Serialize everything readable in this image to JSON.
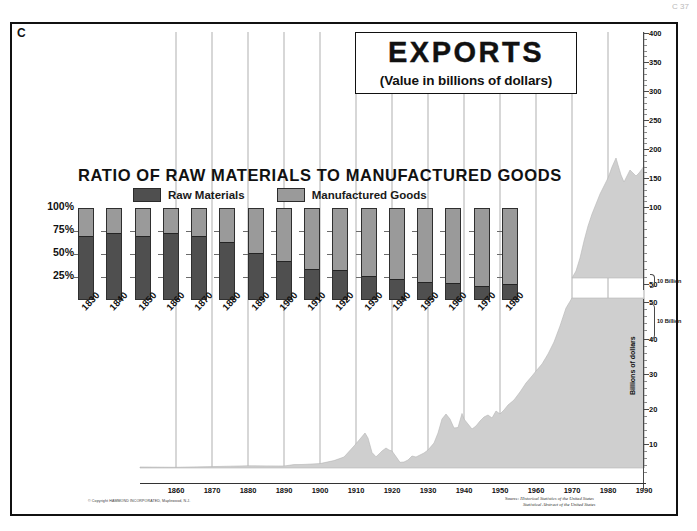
{
  "plate": {
    "letter": "C",
    "page_mark": "C 37"
  },
  "title": {
    "main": "EXPORTS",
    "subtitle": "(Value in billions of dollars)"
  },
  "ratio_panel": {
    "title": "RATIO OF RAW MATERIALS TO MANUFACTURED GOODS",
    "legend": [
      {
        "label": "Raw Materials",
        "color": "#4f4f4f",
        "key": "raw"
      },
      {
        "label": "Manufactured Goods",
        "color": "#9a9a9a",
        "key": "manufactured"
      }
    ],
    "y_ticks": [
      "100%",
      "75%",
      "50%",
      "25%"
    ]
  },
  "axes": {
    "upper_right_ticks": [
      "400",
      "350",
      "300",
      "250",
      "200",
      "150",
      "100",
      "50"
    ],
    "lower_right_ticks": [
      "50",
      "40",
      "30",
      "20",
      "10"
    ],
    "vertical_axis_title": "Billions of dollars",
    "break_note_upper": "10 Billion",
    "break_note_lower": "10 Billion",
    "timeline_years": [
      "1860",
      "1870",
      "1880",
      "1890",
      "1900",
      "1910",
      "1920",
      "1930",
      "1940",
      "1950",
      "1960",
      "1970",
      "1980",
      "1990"
    ]
  },
  "footer": {
    "copyright": "© Copyright HAMMOND INCORPORATED, Maplewood, N.J.",
    "source_label": "Source:",
    "source_line1": "Historical Statistics of the United States",
    "source_line2": "Statistical Abstract of the United States"
  },
  "colors": {
    "raw_materials": "#4f4f4f",
    "manufactured_goods": "#9a9a9a",
    "area_fill": "#cfcfcf",
    "frame": "#111111"
  },
  "chart_data": [
    {
      "type": "bar",
      "id": "ratio-stacked-bars",
      "title": "RATIO OF RAW MATERIALS TO MANUFACTURED GOODS",
      "xlabel": "",
      "ylabel": "",
      "ylim": [
        0,
        100
      ],
      "stacked": true,
      "grid": false,
      "legend_position": "top",
      "categories": [
        "1830",
        "1840",
        "1850",
        "1860",
        "1870",
        "1880",
        "1890",
        "1900",
        "1910",
        "1920",
        "1930",
        "1940",
        "1950",
        "1960",
        "1970",
        "1980"
      ],
      "tick_labels": [
        "100%",
        "75%",
        "50%",
        "25%"
      ],
      "series": [
        {
          "name": "Raw Materials",
          "color": "#4f4f4f",
          "values": [
            68,
            72,
            69,
            72,
            68,
            62,
            50,
            41,
            33,
            31,
            25,
            22,
            18,
            17,
            14,
            16
          ]
        },
        {
          "name": "Manufactured Goods",
          "color": "#9a9a9a",
          "values": [
            32,
            28,
            31,
            28,
            32,
            38,
            50,
            59,
            67,
            69,
            75,
            78,
            82,
            83,
            86,
            84
          ]
        }
      ]
    },
    {
      "type": "area",
      "id": "exports-value-area",
      "title": "EXPORTS",
      "subtitle": "(Value in billions of dollars)",
      "xlabel": "",
      "ylabel": "Billions of dollars",
      "grid": true,
      "axis_break": true,
      "xlim": [
        1860,
        1990
      ],
      "lower_ylim": [
        0,
        50
      ],
      "upper_ylim": [
        50,
        400
      ],
      "x": [
        1860,
        1865,
        1870,
        1875,
        1880,
        1885,
        1890,
        1895,
        1900,
        1905,
        1910,
        1915,
        1918,
        1920,
        1921,
        1922,
        1925,
        1929,
        1930,
        1932,
        1933,
        1935,
        1937,
        1938,
        1940,
        1942,
        1944,
        1945,
        1946,
        1947,
        1948,
        1949,
        1950,
        1951,
        1953,
        1955,
        1957,
        1958,
        1960,
        1962,
        1964,
        1966,
        1968,
        1970,
        1972,
        1974,
        1975,
        1977,
        1979,
        1980,
        1981,
        1982,
        1984,
        1986,
        1988,
        1989,
        1990
      ],
      "y": [
        0.4,
        0.2,
        0.5,
        0.6,
        0.9,
        0.8,
        0.9,
        0.8,
        1.5,
        1.5,
        1.7,
        2.8,
        6.1,
        8.2,
        4.5,
        3.8,
        4.9,
        5.2,
        3.8,
        1.6,
        1.7,
        2.3,
        3.3,
        3.1,
        4.0,
        8.0,
        14.3,
        9.8,
        11.8,
        16.0,
        13.2,
        12.1,
        10.2,
        14.2,
        15.8,
        15.5,
        19.6,
        16.4,
        19.6,
        21.0,
        26.0,
        30.0,
        34.0,
        42.6,
        49.8,
        98.5,
        107.6,
        121.2,
        181.8,
        220.8,
        233.7,
        212.3,
        224.0,
        217.3,
        320.3,
        363.8,
        393.6
      ],
      "annotations": [
        "Axis break between 50 and 50 (upper scale resumes at 50 billion)"
      ]
    }
  ]
}
